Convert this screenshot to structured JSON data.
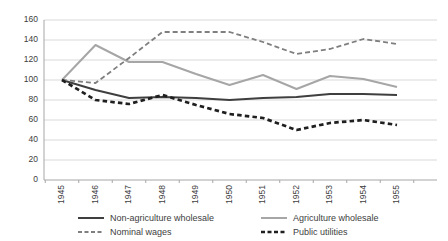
{
  "chart_data": {
    "type": "line",
    "title": "",
    "xlabel": "",
    "ylabel": "",
    "x_categories": [
      "1945",
      "1946",
      "1947",
      "1948",
      "1949",
      "1950",
      "1951",
      "1952",
      "1953",
      "1954",
      "1955"
    ],
    "ylim": [
      0,
      160
    ],
    "yticks": [
      0,
      20,
      40,
      60,
      80,
      100,
      120,
      140,
      160
    ],
    "grid": "horizontal",
    "legend_position": "bottom",
    "series": [
      {
        "name": "Non-agriculture wholesale",
        "values": [
          100,
          90,
          82,
          83,
          82,
          80,
          82,
          83,
          86,
          86,
          85
        ],
        "color": "#3f3f3f",
        "style": "solid",
        "width": 2
      },
      {
        "name": "Agriculture wholesale",
        "values": [
          100,
          135,
          118,
          118,
          106,
          95,
          105,
          91,
          104,
          101,
          93
        ],
        "color": "#a6a6a6",
        "style": "solid",
        "width": 2
      },
      {
        "name": "Nominal wages",
        "values": [
          100,
          97,
          122,
          148,
          148,
          148,
          138,
          126,
          131,
          141,
          136
        ],
        "color": "#7f7f7f",
        "style": "dashed",
        "width": 1.8
      },
      {
        "name": "Public utilities",
        "values": [
          100,
          80,
          76,
          85,
          75,
          66,
          62,
          50,
          57,
          60,
          55
        ],
        "color": "#1f1f1f",
        "style": "dashed-bold",
        "width": 2.7
      }
    ],
    "colors": {
      "gridline": "#d9d9d9",
      "axis": "#a6a6a6",
      "tick_text": "#404040",
      "background": "#ffffff"
    }
  }
}
